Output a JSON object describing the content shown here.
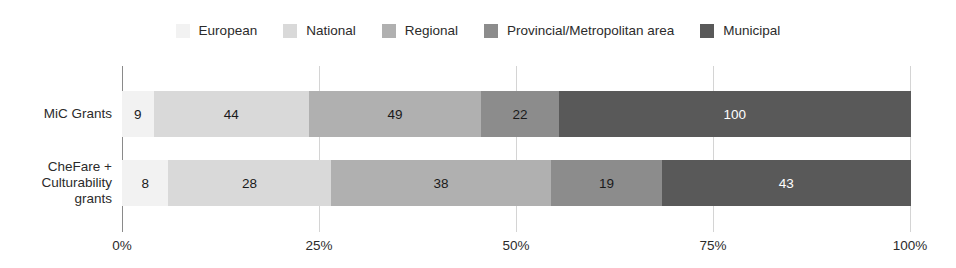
{
  "chart_data": {
    "type": "bar",
    "orientation": "horizontal",
    "stacked": true,
    "normalized": true,
    "title": "",
    "subtitle": "",
    "xlabel": "",
    "ylabel": "",
    "xlim": [
      0,
      100
    ],
    "grid": true,
    "legend_position": "top-center",
    "xticks": [
      "0%",
      "25%",
      "50%",
      "75%",
      "100%"
    ],
    "xtick_values": [
      0,
      25,
      50,
      75,
      100
    ],
    "categories": [
      "MiC Grants",
      "CheFare +\nCulturability\ngrants"
    ],
    "category_lines": [
      [
        "MiC Grants"
      ],
      [
        "CheFare +",
        "Culturability",
        "grants"
      ]
    ],
    "series": [
      {
        "name": "European",
        "color": "#f2f2f2",
        "label_color": "#1a1a1a",
        "values": [
          9,
          8
        ]
      },
      {
        "name": "National",
        "color": "#d9d9d9",
        "label_color": "#1a1a1a",
        "values": [
          44,
          28
        ]
      },
      {
        "name": "Regional",
        "color": "#b0b0b0",
        "label_color": "#1a1a1a",
        "values": [
          49,
          38
        ]
      },
      {
        "name": "Provincial/Metropolitan area",
        "color": "#8c8c8c",
        "label_color": "#1a1a1a",
        "values": [
          22,
          19
        ]
      },
      {
        "name": "Municipal",
        "color": "#595959",
        "label_color": "#ffffff",
        "values": [
          100,
          43
        ]
      }
    ],
    "row_totals": [
      224,
      136
    ]
  },
  "legend": {
    "items": [
      {
        "label": "European",
        "color": "#f2f2f2"
      },
      {
        "label": "National",
        "color": "#d9d9d9"
      },
      {
        "label": "Regional",
        "color": "#b0b0b0"
      },
      {
        "label": "Provincial/Metropolitan area",
        "color": "#8c8c8c"
      },
      {
        "label": "Municipal",
        "color": "#595959"
      }
    ]
  },
  "axis": {
    "x_ticks": [
      "0%",
      "25%",
      "50%",
      "75%",
      "100%"
    ],
    "y_categories": [
      "MiC Grants",
      "CheFare + Culturability grants"
    ]
  },
  "colors": {
    "gridline": "#d4d4d4",
    "axis": "#8a8a8a",
    "text": "#2b2b2b",
    "background": "#ffffff"
  }
}
